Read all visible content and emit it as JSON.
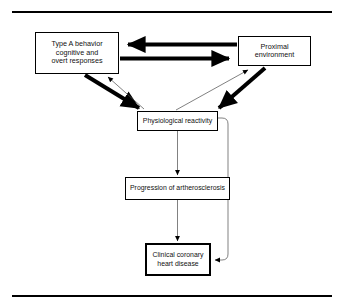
{
  "figure": {
    "kind": "flow-diagram",
    "background_color": "#ffffff",
    "line_color": "#000000",
    "rules": {
      "top_label": "top horizontal rule",
      "bottom_label": "bottom horizontal rule"
    },
    "nodes": [
      {
        "id": "type-a",
        "label": "Type A behavior\ncognitive and\novert responses",
        "emphasis": false
      },
      {
        "id": "proximal",
        "label": "Proximal\nenvironment",
        "emphasis": false
      },
      {
        "id": "physiological",
        "label": "Physiological  reactivity",
        "emphasis": false
      },
      {
        "id": "progression",
        "label": "Progression  of  artherosclerosis",
        "emphasis": false
      },
      {
        "id": "clinical",
        "label": "Clinical  coronary\nheart  disease",
        "emphasis": true
      }
    ],
    "edges": [
      {
        "id": "proximal-to-type-a",
        "from": "proximal",
        "to": "type-a",
        "weight": "thick",
        "direction": "left"
      },
      {
        "id": "type-a-to-proximal",
        "from": "type-a",
        "to": "proximal",
        "weight": "thick",
        "direction": "right"
      },
      {
        "id": "type-a-to-physiological",
        "from": "type-a",
        "to": "physiological",
        "weight": "thick",
        "direction": "down-right"
      },
      {
        "id": "proximal-to-physiological",
        "from": "proximal",
        "to": "physiological",
        "weight": "thick",
        "direction": "down-left"
      },
      {
        "id": "physiological-to-type-a",
        "from": "physiological",
        "to": "type-a",
        "weight": "thin",
        "direction": "up-left"
      },
      {
        "id": "physiological-to-proximal",
        "from": "physiological",
        "to": "proximal",
        "weight": "thin",
        "direction": "up-right"
      },
      {
        "id": "physiological-to-progression",
        "from": "physiological",
        "to": "progression",
        "weight": "thin",
        "direction": "down"
      },
      {
        "id": "progression-to-clinical",
        "from": "progression",
        "to": "clinical",
        "weight": "thin",
        "direction": "down"
      },
      {
        "id": "physiological-to-clinical-feedback",
        "from": "physiological",
        "to": "clinical",
        "weight": "thin",
        "direction": "right-down-left"
      }
    ]
  }
}
